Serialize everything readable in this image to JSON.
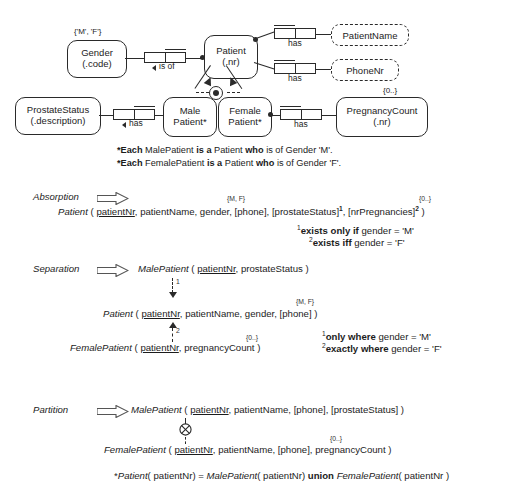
{
  "diagram": {
    "entities": [
      {
        "id": "gender",
        "line1": "Gender",
        "line2": "(.code)"
      },
      {
        "id": "patient",
        "line1": "Patient",
        "line2": "(.nr)"
      },
      {
        "id": "prostate_status",
        "line1": "ProstateStatus",
        "line2": "(.description)"
      },
      {
        "id": "male_patient",
        "line1": "Male",
        "line2": "Patient*"
      },
      {
        "id": "female_patient",
        "line1": "Female",
        "line2": "Patient*"
      },
      {
        "id": "pregnancy_count",
        "line1": "PregnancyCount",
        "line2": "(.nr)"
      }
    ],
    "value_types": [
      {
        "id": "patient_name",
        "label": "PatientName"
      },
      {
        "id": "phone_nr",
        "label": "PhoneNr"
      }
    ],
    "predicates": [
      {
        "id": "gender_is_of",
        "label": "is of",
        "arrow": "left"
      },
      {
        "id": "patient_has_name",
        "label": "has",
        "arrow": "none"
      },
      {
        "id": "patient_has_phone",
        "label": "has",
        "arrow": "none"
      },
      {
        "id": "prostate_has",
        "label": "has",
        "arrow": "left"
      },
      {
        "id": "pregnancy_has",
        "label": "has",
        "arrow": "none"
      }
    ],
    "value_constraints": [
      {
        "id": "gender_values",
        "text": "{'M', 'F'}"
      },
      {
        "id": "pregnancy_values",
        "text": "{0..}"
      }
    ],
    "footnotes": [
      {
        "star": "*",
        "b1": "Each",
        "t1": " MalePatient ",
        "b2": "is a",
        "t2": " Patient ",
        "b3": "who",
        "t3": " is of Gender 'M'."
      },
      {
        "star": "*",
        "b1": "Each",
        "t1": " FemalePatient ",
        "b2": "is a",
        "t2": " Patient ",
        "b3": "who",
        "t3": " is of Gender 'F'."
      }
    ]
  },
  "absorption": {
    "stage_label": "Absorption",
    "constraint_gender": "{M, F}",
    "constraint_pregnancies": "{0..}",
    "schema": {
      "table": "Patient",
      "open": " ( ",
      "pk": "patientNr",
      "rest": ", patientName, gender, [phone], [prostateStatus]",
      "sup1": "1",
      "mid": ", [nrPregnancies]",
      "sup2": "2",
      "close": " )"
    },
    "notes": [
      {
        "marker": "1",
        "bold": "exists only if",
        "rest": " gender = 'M'"
      },
      {
        "marker": "2",
        "bold": "exists iff",
        "rest": " gender = 'F'"
      }
    ]
  },
  "separation": {
    "stage_label": "Separation",
    "male": {
      "table": "MalePatient",
      "open": " ( ",
      "pk": "patientNr",
      "rest": ", prostateStatus )"
    },
    "patient": {
      "table": "Patient",
      "open": " ( ",
      "pk": "patientNr",
      "rest": ", patientName, gender, [phone] )",
      "constraint": "{M, F}"
    },
    "female": {
      "table": "FemalePatient",
      "open": " ( ",
      "pk": "patientNr",
      "rest": ", pregnancyCount )",
      "constraint": "{0..}"
    },
    "arrow_label_1": "1",
    "arrow_label_2": "2",
    "notes": [
      {
        "marker": "1",
        "bold": "only where",
        "rest": " gender = 'M'"
      },
      {
        "marker": "2",
        "bold": "exactly where",
        "rest": " gender = 'F'"
      }
    ]
  },
  "partition": {
    "stage_label": "Partition",
    "male": {
      "table": "MalePatient",
      "open": " ( ",
      "pk": "patientNr",
      "rest": ", patientName, [phone], [prostateStatus] )"
    },
    "female": {
      "table": "FemalePatient",
      "open": " ( ",
      "pk": "patientNr",
      "rest": ", patientName, [phone], pregnancyCount )",
      "constraint": "{0..}"
    },
    "union_note": {
      "star": "*",
      "t1": "Patient",
      "t2": "( patientNr) = ",
      "t3": "MalePatient",
      "t4": "( patientNr) ",
      "b1": "union",
      "t5": " ",
      "t6": "FemalePatient",
      "t7": "( patientNr )"
    }
  },
  "colors": {
    "ink": "#2a2a2a",
    "background": "#ffffff"
  }
}
